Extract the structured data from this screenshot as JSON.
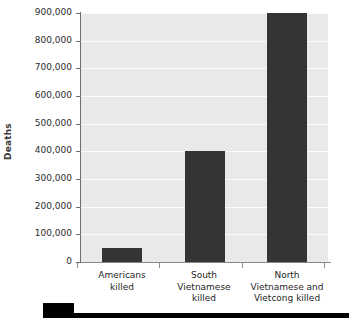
{
  "chart_data": {
    "type": "bar",
    "title": "",
    "subtitle": "",
    "xlabel": "",
    "ylabel": "Deaths",
    "categories": [
      "Americans\nkilled",
      "South\nVietnamese\nkilled",
      "North\nVietnamese and\nVietcong killed"
    ],
    "values": [
      50000,
      400000,
      900000
    ],
    "ylim": [
      0,
      900000
    ],
    "ytick_values": [
      0,
      100000,
      200000,
      300000,
      400000,
      500000,
      600000,
      700000,
      800000,
      900000
    ],
    "ytick_labels": [
      "0",
      "100,000",
      "200,000",
      "300,000",
      "400,000",
      "500,000",
      "600,000",
      "700,000",
      "800,000",
      "900,000"
    ],
    "grid": true,
    "legend": "none",
    "colors": {
      "bar_fill": "#343434",
      "plot_background": "#e9e9e9",
      "gridline": "#fbfbfb",
      "axis_line": "#6e6e6e",
      "tick_label": "#2c2c2c",
      "axis_title": "#3a3a3a",
      "page_background": "#ffffff",
      "footer": "#000000"
    }
  }
}
